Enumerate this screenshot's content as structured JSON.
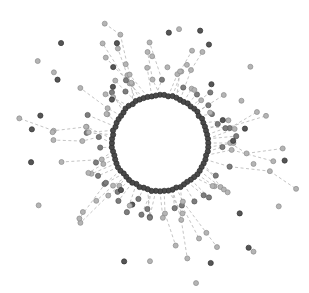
{
  "figure": {
    "title": "",
    "width": 309,
    "height": 293,
    "background_color": "#ffffff",
    "type": "radial-network-graph"
  },
  "graph": {
    "layout": "radial",
    "center_x": 160,
    "center_y": 143,
    "ring_radius": 48,
    "ring_node_count": 72,
    "ring_node_radius": 2.6,
    "ring_node_color": "#4a4a4a",
    "ring_node_stroke": "#2e2e2e",
    "ring_node_stroke_width": 0.7,
    "hub_node_color": "#555555",
    "hub_node_stroke": "#333333",
    "hub_node_radius": 2.9,
    "leaf_node_color": "#b4b4b4",
    "leaf_node_stroke": "#8c8c8c",
    "leaf_node_radius": 2.5,
    "mid_node_color": "#7d7d7d",
    "mid_node_stroke": "#5a5a5a",
    "mid_node_radius": 2.6,
    "edge_color": "#aaaaaa",
    "edge_width": 0.7,
    "edge_dash": "3,2.5",
    "branch_min_radius": 58,
    "branch_max_radius": 148,
    "branch_count": 72,
    "branch_chain_min": 1,
    "branch_chain_max": 3,
    "angle_jitter_deg": 7,
    "random_seed": 20240917
  },
  "legend": {
    "visible": false,
    "entries": []
  },
  "axes": {
    "visible": false,
    "xlabel": "",
    "ylabel": ""
  },
  "annotations": []
}
